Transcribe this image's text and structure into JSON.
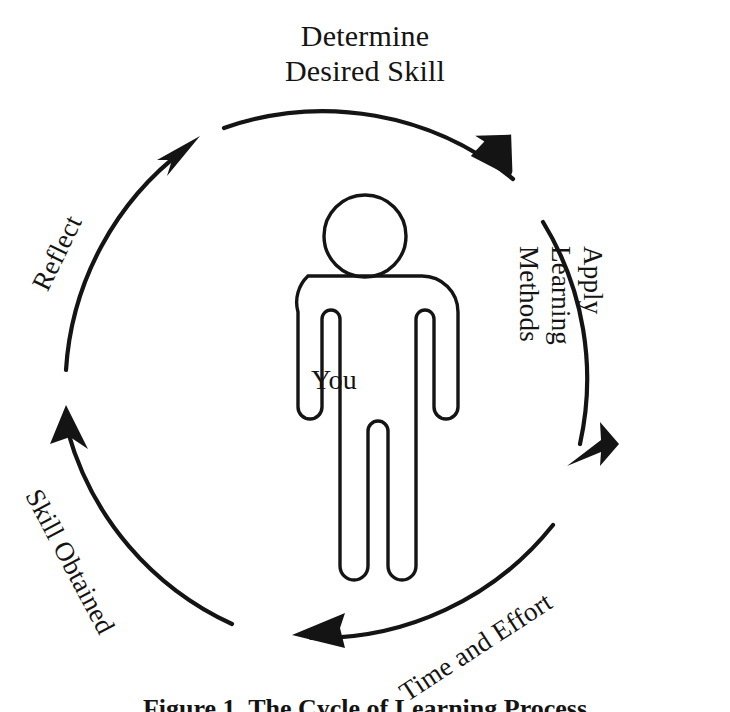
{
  "diagram": {
    "title_label": "Determine Desired Skill",
    "center_label": "You",
    "caption": "Figure 1. The Cycle of Learning Process",
    "stroke_color": "#141414",
    "background_color": "#ffffff",
    "stages": [
      {
        "id": "determine-desired-skill",
        "line1": "Determine",
        "line2": "Desired Skill",
        "position": "top",
        "rotation_deg": 0
      },
      {
        "id": "apply-learning-methods",
        "line1": "Apply",
        "line2": "Learning",
        "line3": "Methods",
        "position": "right",
        "rotation_deg": 90
      },
      {
        "id": "time-and-effort",
        "line1": "Time and Effort",
        "position": "bottom-right",
        "rotation_deg": -33
      },
      {
        "id": "skill-obtained",
        "line1": "Skill Obtained",
        "position": "bottom-left",
        "rotation_deg": 62
      },
      {
        "id": "reflect",
        "line1": "Reflect",
        "position": "top-left",
        "rotation_deg": -64
      }
    ],
    "center_figure": {
      "name": "person-pictogram",
      "label": "You"
    },
    "arrows": [
      {
        "id": "arrow-to-apply",
        "points_to": "apply-learning-methods"
      },
      {
        "id": "arrow-to-time-effort",
        "points_to": "time-and-effort"
      },
      {
        "id": "arrow-to-skill-obtained",
        "points_to": "skill-obtained"
      },
      {
        "id": "arrow-to-reflect",
        "points_to": "reflect"
      },
      {
        "id": "arrow-to-determine",
        "points_to": "determine-desired-skill"
      }
    ]
  }
}
